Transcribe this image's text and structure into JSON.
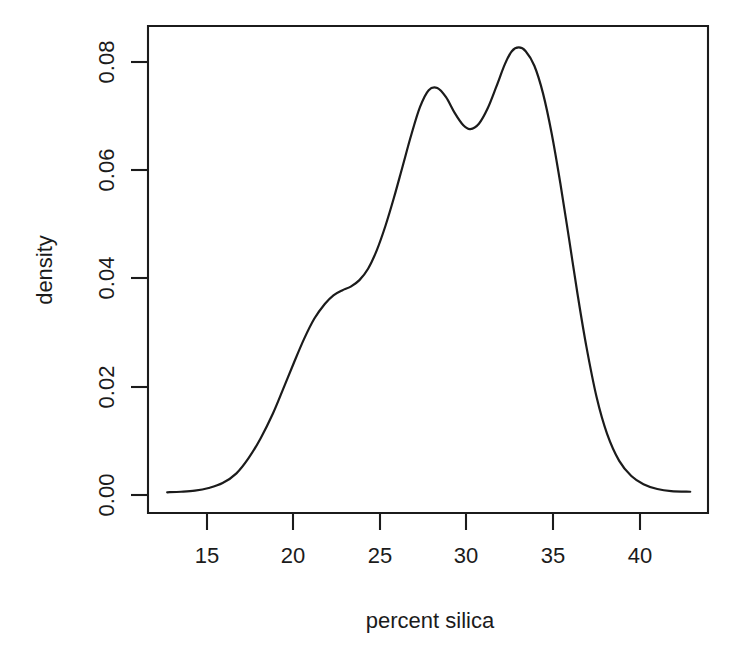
{
  "chart_data": {
    "type": "line",
    "title": "",
    "subtitle": "",
    "xlabel": "percent silica",
    "ylabel": "density",
    "xlim": [
      12.7,
      42.9
    ],
    "ylim": [
      0.0,
      0.0885
    ],
    "grid": false,
    "legend": null,
    "xticks": [
      15,
      20,
      25,
      30,
      35,
      40
    ],
    "xtick_labels": [
      "15",
      "20",
      "25",
      "30",
      "35",
      "40"
    ],
    "yticks": [
      0.0,
      0.02,
      0.04,
      0.06,
      0.08
    ],
    "ytick_labels": [
      "0.00",
      "0.02",
      "0.04",
      "0.06",
      "0.08"
    ],
    "series": [
      {
        "name": "density",
        "x": [
          12.7,
          13.5,
          14.3,
          15.1,
          15.9,
          16.7,
          17.4,
          18.1,
          18.8,
          19.4,
          20.0,
          20.6,
          21.2,
          21.8,
          22.3,
          22.8,
          23.3,
          23.8,
          24.3,
          24.8,
          25.3,
          25.8,
          26.3,
          26.8,
          27.3,
          27.8,
          28.3,
          28.8,
          29.3,
          29.8,
          30.2,
          30.7,
          31.2,
          31.7,
          32.2,
          32.6,
          33.0,
          33.4,
          33.9,
          34.4,
          34.9,
          35.4,
          35.9,
          36.4,
          36.9,
          37.5,
          38.1,
          38.8,
          39.5,
          40.2,
          41.0,
          41.8,
          42.9
        ],
        "y": [
          0.0005,
          0.0006,
          0.0008,
          0.0013,
          0.0022,
          0.004,
          0.0068,
          0.0105,
          0.015,
          0.0196,
          0.0243,
          0.0288,
          0.0326,
          0.0353,
          0.0369,
          0.0378,
          0.0385,
          0.0397,
          0.0418,
          0.0452,
          0.0497,
          0.055,
          0.0608,
          0.0666,
          0.0717,
          0.0748,
          0.0752,
          0.0735,
          0.0706,
          0.0683,
          0.0676,
          0.0686,
          0.0714,
          0.0754,
          0.0796,
          0.082,
          0.0827,
          0.082,
          0.0793,
          0.0742,
          0.0668,
          0.0576,
          0.0474,
          0.037,
          0.0275,
          0.018,
          0.0113,
          0.0063,
          0.0035,
          0.002,
          0.0011,
          0.0007,
          0.0006
        ]
      }
    ],
    "peaks": [
      {
        "x": 27.8,
        "y": 0.0754,
        "label": "first mode"
      },
      {
        "x": 33.0,
        "y": 0.0827,
        "label": "second mode"
      }
    ],
    "valley": {
      "x": 30.2,
      "y": 0.0676
    },
    "shoulder": {
      "x": 22.8,
      "y": 0.0378
    },
    "colors": {
      "curve": "#1b1b1b",
      "axis": "#1b1b1b",
      "background": "#ffffff",
      "text": "#1b1b1b"
    }
  }
}
